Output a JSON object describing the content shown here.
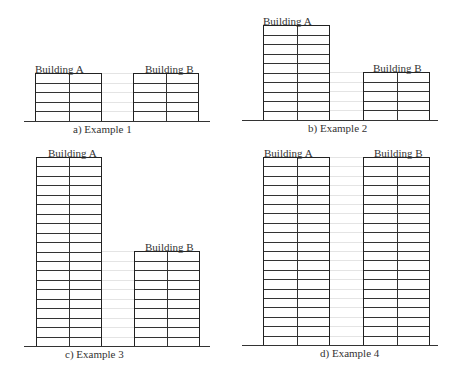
{
  "figure": {
    "panels": [
      {
        "id": "a",
        "caption": "a) Example 1",
        "ground": {
          "x1": 24,
          "x2": 210,
          "y": 121
        },
        "caption_pos": {
          "x": 73,
          "y": 124
        },
        "buildings": [
          {
            "label": "Building A",
            "stories": 5,
            "x": 35,
            "w": 67,
            "top": 73,
            "label_x": 35
          },
          {
            "label": "Building B",
            "stories": 5,
            "x": 133,
            "w": 66,
            "top": 73,
            "label_x": 145
          }
        ]
      },
      {
        "id": "b",
        "caption": "b) Example 2",
        "ground": {
          "x1": 242,
          "x2": 438,
          "y": 120
        },
        "caption_pos": {
          "x": 308,
          "y": 123
        },
        "buildings": [
          {
            "label": "Building A",
            "stories": 10,
            "x": 263,
            "w": 67,
            "top": 25,
            "label_x": 263
          },
          {
            "label": "Building B",
            "stories": 5,
            "x": 363,
            "w": 67,
            "top": 72,
            "label_x": 373
          }
        ]
      },
      {
        "id": "c",
        "caption": "c) Example 3",
        "ground": {
          "x1": 24,
          "x2": 210,
          "y": 346
        },
        "caption_pos": {
          "x": 65,
          "y": 349
        },
        "buildings": [
          {
            "label": "Building A",
            "stories": 20,
            "x": 36,
            "w": 66,
            "top": 157,
            "label_x": 48
          },
          {
            "label": "Building B",
            "stories": 10,
            "x": 134,
            "w": 66,
            "top": 251,
            "label_x": 145
          }
        ]
      },
      {
        "id": "d",
        "caption": "d) Example 4",
        "ground": {
          "x1": 242,
          "x2": 438,
          "y": 345
        },
        "caption_pos": {
          "x": 320,
          "y": 348
        },
        "buildings": [
          {
            "label": "Building A",
            "stories": 20,
            "x": 263,
            "w": 67,
            "top": 157,
            "label_x": 264
          },
          {
            "label": "Building B",
            "stories": 20,
            "x": 363,
            "w": 67,
            "top": 157,
            "label_x": 374
          }
        ]
      }
    ]
  }
}
